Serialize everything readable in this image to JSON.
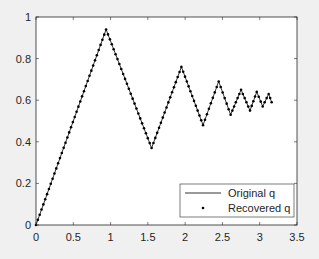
{
  "chart_data": {
    "type": "line",
    "title": "",
    "xlabel": "",
    "ylabel": "",
    "xlim": [
      0,
      3.5
    ],
    "ylim": [
      0,
      1
    ],
    "xticks": [
      "0",
      "0.5",
      "1",
      "1.5",
      "2",
      "2.5",
      "3",
      "3.5"
    ],
    "yticks": [
      "0",
      "0.2",
      "0.4",
      "0.6",
      "0.8",
      "1"
    ],
    "grid": false,
    "legend_position": "lower right",
    "series": [
      {
        "name": "Original q",
        "style": "solid line",
        "color": "#000000"
      },
      {
        "name": "Recovered q",
        "style": "dot markers",
        "color": "#000000"
      }
    ],
    "vertices": [
      {
        "x": 0.0,
        "y": 0.0
      },
      {
        "x": 0.94,
        "y": 0.94
      },
      {
        "x": 1.55,
        "y": 0.37
      },
      {
        "x": 1.95,
        "y": 0.76
      },
      {
        "x": 2.24,
        "y": 0.48
      },
      {
        "x": 2.45,
        "y": 0.69
      },
      {
        "x": 2.61,
        "y": 0.53
      },
      {
        "x": 2.75,
        "y": 0.65
      },
      {
        "x": 2.87,
        "y": 0.55
      },
      {
        "x": 2.96,
        "y": 0.64
      },
      {
        "x": 3.04,
        "y": 0.57
      },
      {
        "x": 3.12,
        "y": 0.63
      },
      {
        "x": 3.16,
        "y": 0.59
      }
    ],
    "point_spacing": 0.025
  },
  "legend": {
    "original_label": "Original q",
    "recovered_label": "Recovered q"
  }
}
